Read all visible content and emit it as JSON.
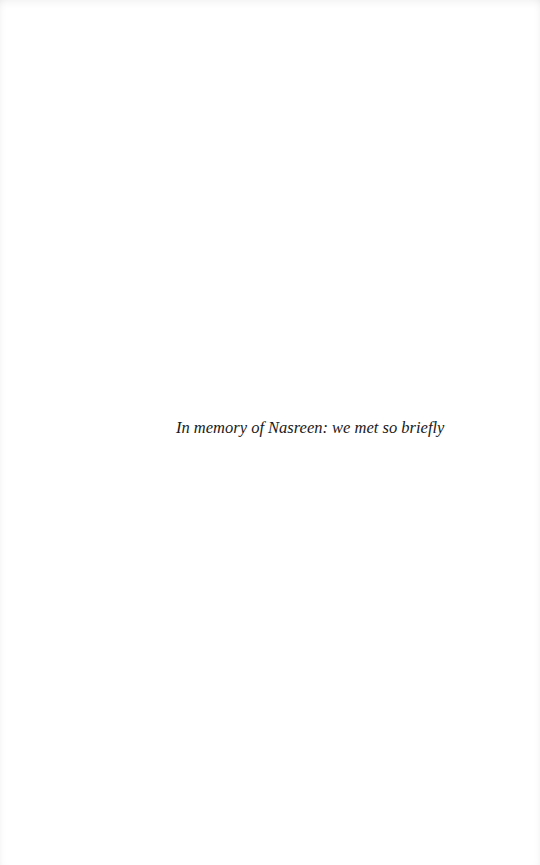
{
  "page": {
    "type": "dedication",
    "dedication_text": "In memory of Nasreen: we met so briefly"
  }
}
